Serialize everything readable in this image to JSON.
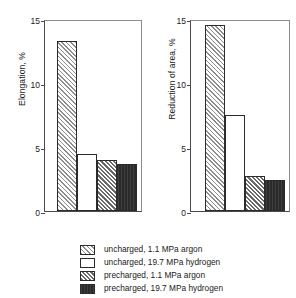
{
  "chart_data": [
    {
      "type": "bar",
      "panel": "left",
      "title": "",
      "xlabel": "",
      "ylabel": "Elongation, %",
      "ylim": [
        0,
        15
      ],
      "yticks": [
        0,
        5,
        10,
        15
      ],
      "ytick_labels": [
        "0",
        "5",
        "10",
        "15"
      ],
      "grid": false,
      "legend_position": "below-figure",
      "categories": [
        "uncharged, 1.1 MPa argon",
        "uncharged, 19.7 MPa hydrogen",
        "precharged, 1.1 MPa argon",
        "precharged, 19.7 MPa hydrogen"
      ],
      "values": [
        13.3,
        4.45,
        3.95,
        3.65
      ]
    },
    {
      "type": "bar",
      "panel": "right",
      "title": "",
      "xlabel": "",
      "ylabel": "Reduction of area, %",
      "ylim": [
        0,
        15
      ],
      "yticks": [
        0,
        5,
        10,
        15
      ],
      "ytick_labels": [
        "0",
        "5",
        "10",
        "15"
      ],
      "grid": false,
      "legend_position": "below-figure",
      "categories": [
        "uncharged, 1.1 MPa argon",
        "uncharged, 19.7 MPa hydrogen",
        "precharged, 1.1 MPa argon",
        "precharged, 19.7 MPa hydrogen"
      ],
      "values": [
        14.5,
        7.5,
        2.7,
        2.45
      ]
    }
  ],
  "legend": {
    "items": [
      {
        "label": "uncharged, 1.1 MPa argon",
        "pattern": "hatch-light"
      },
      {
        "label": "uncharged, 19.7 MPa hydrogen",
        "pattern": "open"
      },
      {
        "label": "precharged, 1.1 MPa argon",
        "pattern": "hatch-dark"
      },
      {
        "label": "precharged, 19.7 MPa hydrogen",
        "pattern": "solid"
      }
    ]
  },
  "colors": {
    "axis": "#4a4a4a",
    "bar_edge": "#2b2b2b",
    "hatch_light": "#8e8e8e",
    "hatch_dark": "#6a6a6a",
    "solid_fill": "#2a2a2a",
    "background": "#ffffff",
    "text": "#1a1a1a"
  }
}
